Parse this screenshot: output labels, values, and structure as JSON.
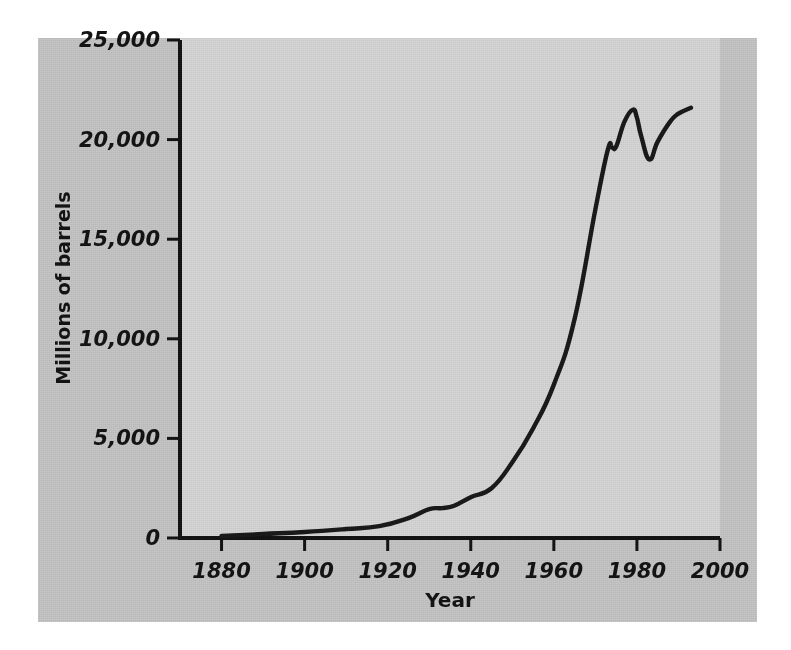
{
  "figure": {
    "background_color": "#c6c6c6",
    "panel_color": "#d7d7d7",
    "line_color": "#1a1a1a"
  },
  "chart_data": {
    "type": "line",
    "title": "",
    "xlabel": "Year",
    "ylabel": "Millions of barrels",
    "xlim": [
      1870,
      2000
    ],
    "ylim": [
      0,
      25000
    ],
    "xticks": [
      1880,
      1900,
      1920,
      1940,
      1960,
      1980,
      2000
    ],
    "xtick_labels": [
      "1880",
      "1900",
      "1920",
      "1940",
      "1960",
      "1980",
      "2000"
    ],
    "yticks": [
      0,
      5000,
      10000,
      15000,
      20000,
      25000
    ],
    "ytick_labels": [
      "0",
      "5,000",
      "10,000",
      "15,000",
      "20,000",
      "25,000"
    ],
    "grid": false,
    "legend": false,
    "series": [
      {
        "name": "World crude oil production",
        "x": [
          1880,
          1890,
          1900,
          1910,
          1918,
          1925,
          1930,
          1933,
          1936,
          1940,
          1945,
          1950,
          1955,
          1960,
          1965,
          1970,
          1973,
          1974,
          1975,
          1977,
          1979,
          1980,
          1981,
          1983,
          1985,
          1988,
          1990,
          1993
        ],
        "values": [
          100,
          200,
          300,
          450,
          600,
          1000,
          1450,
          1500,
          1620,
          2050,
          2500,
          3800,
          5500,
          7700,
          11000,
          16500,
          19500,
          19600,
          19650,
          20900,
          21500,
          21100,
          20200,
          19000,
          19900,
          20900,
          21300,
          21600
        ]
      }
    ]
  }
}
